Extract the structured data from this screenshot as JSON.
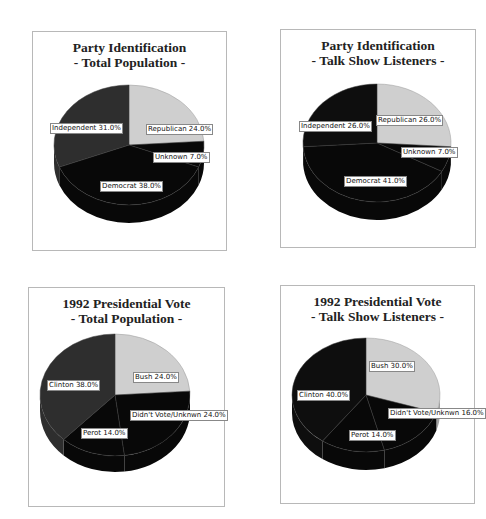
{
  "charts": [
    {
      "title_line1": "Party Identification",
      "title_line2": "- Total Population -",
      "slices": [
        {
          "label": "Republican 24.0%",
          "name": "Republican",
          "value": 24.0,
          "color": "#cfcfcf"
        },
        {
          "label": "Unknown 7.0%",
          "name": "Unknown",
          "value": 7.0,
          "color": "#080808"
        },
        {
          "label": "Democrat 38.0%",
          "name": "Democrat",
          "value": 38.0,
          "color": "#080808"
        },
        {
          "label": "Independent 31.0%",
          "name": "Independent",
          "value": 31.0,
          "color": "#2e2e2e"
        }
      ]
    },
    {
      "title_line1": "Party Identification",
      "title_line2": "- Talk Show Listeners -",
      "slices": [
        {
          "label": "Republican 26.0%",
          "name": "Republican",
          "value": 26.0,
          "color": "#cfcfcf"
        },
        {
          "label": "Unknown 7.0%",
          "name": "Unknown",
          "value": 7.0,
          "color": "#080808"
        },
        {
          "label": "Democrat 41.0%",
          "name": "Democrat",
          "value": 41.0,
          "color": "#080808"
        },
        {
          "label": "Independent 26.0%",
          "name": "Independent",
          "value": 26.0,
          "color": "#0e0e0e"
        }
      ]
    },
    {
      "title_line1": "1992 Presidential Vote",
      "title_line2": "- Total Population -",
      "slices": [
        {
          "label": "Bush 24.0%",
          "name": "Bush",
          "value": 24.0,
          "color": "#cfcfcf"
        },
        {
          "label": "Didn't Vote/Unknwn 24.0%",
          "name": "Didn't Vote/Unknwn",
          "value": 24.0,
          "color": "#080808"
        },
        {
          "label": "Perot 14.0%",
          "name": "Perot",
          "value": 14.0,
          "color": "#080808"
        },
        {
          "label": "Clinton 38.0%",
          "name": "Clinton",
          "value": 38.0,
          "color": "#2e2e2e"
        }
      ]
    },
    {
      "title_line1": "1992 Presidential Vote",
      "title_line2": "- Talk Show Listeners -",
      "slices": [
        {
          "label": "Bush 30.0%",
          "name": "Bush",
          "value": 30.0,
          "color": "#cfcfcf"
        },
        {
          "label": "Didn't Vote/Unknwn 16.0%",
          "name": "Didn't Vote/Unknwn",
          "value": 16.0,
          "color": "#080808"
        },
        {
          "label": "Perot 14.0%",
          "name": "Perot",
          "value": 14.0,
          "color": "#080808"
        },
        {
          "label": "Clinton 40.0%",
          "name": "Clinton",
          "value": 40.0,
          "color": "#0e0e0e"
        }
      ]
    }
  ],
  "chart_data": [
    {
      "type": "pie",
      "title": "Party Identification - Total Population -",
      "categories": [
        "Republican",
        "Unknown",
        "Democrat",
        "Independent"
      ],
      "values": [
        24.0,
        7.0,
        38.0,
        31.0
      ],
      "unit": "%",
      "legend": "none (inline labels)"
    },
    {
      "type": "pie",
      "title": "Party Identification - Talk Show Listeners -",
      "categories": [
        "Republican",
        "Unknown",
        "Democrat",
        "Independent"
      ],
      "values": [
        26.0,
        7.0,
        41.0,
        26.0
      ],
      "unit": "%",
      "legend": "none (inline labels)"
    },
    {
      "type": "pie",
      "title": "1992 Presidential Vote - Total Population -",
      "categories": [
        "Bush",
        "Didn't Vote/Unknwn",
        "Perot",
        "Clinton"
      ],
      "values": [
        24.0,
        24.0,
        14.0,
        38.0
      ],
      "unit": "%",
      "legend": "none (inline labels)"
    },
    {
      "type": "pie",
      "title": "1992 Presidential Vote - Talk Show Listeners -",
      "categories": [
        "Bush",
        "Didn't Vote/Unknwn",
        "Perot",
        "Clinton"
      ],
      "values": [
        30.0,
        16.0,
        14.0,
        40.0
      ],
      "unit": "%",
      "legend": "none (inline labels)"
    }
  ]
}
